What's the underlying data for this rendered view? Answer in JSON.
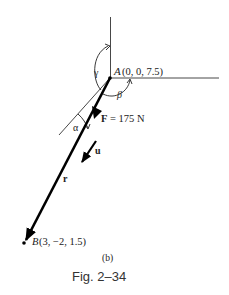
{
  "figure": {
    "point_a": {
      "name": "A",
      "coords": "(0, 0, 7.5)"
    },
    "point_b": {
      "name": "B",
      "coords": "(3, −2, 1.5)"
    },
    "force": {
      "symbol": "F",
      "label": " = 175 N"
    },
    "vectors": {
      "unit": "u",
      "position": "r"
    },
    "angles": {
      "alpha": "α",
      "beta": "β",
      "gamma": "γ"
    },
    "subfigure_label": "(b)",
    "caption": "Fig. 2–34"
  }
}
